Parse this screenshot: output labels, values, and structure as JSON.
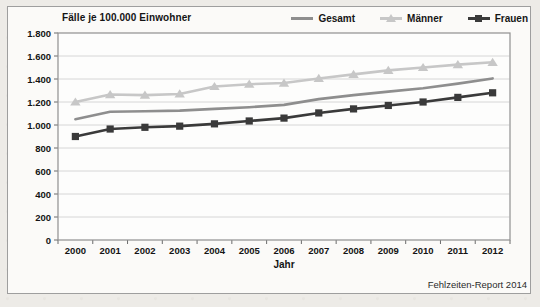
{
  "figure": {
    "title": "Fälle je 100.000 Einwohner",
    "x_axis_title": "Jahr",
    "source": "Fehlzeiten-Report 2014"
  },
  "colors": {
    "gesamt": "#8e8e8e",
    "maenner": "#c7c7c7",
    "frauen": "#3a3a3a",
    "grid": "#d6d6d6",
    "plot_border": "#8f8f8f",
    "plot_background": "#fdfdfc",
    "tick": "#6b6b6b",
    "text": "#141414"
  },
  "chart_data": {
    "type": "line",
    "title": "Fälle je 100.000 Einwohner",
    "xlabel": "Jahr",
    "ylabel": "Fälle je 100.000 Einwohner",
    "x": [
      2000,
      2001,
      2002,
      2003,
      2004,
      2005,
      2006,
      2007,
      2008,
      2009,
      2010,
      2011,
      2012
    ],
    "x_tick_labels": [
      "2000",
      "2001",
      "2002",
      "2003",
      "2004",
      "2005",
      "2006",
      "2007",
      "2008",
      "2009",
      "2010",
      "2011",
      "2012"
    ],
    "series": [
      {
        "name": "Gesamt",
        "marker": "none",
        "color": "#8e8e8e",
        "values": [
          1050,
          1115,
          1120,
          1125,
          1140,
          1155,
          1175,
          1225,
          1260,
          1290,
          1320,
          1360,
          1405
        ]
      },
      {
        "name": "Männer",
        "marker": "triangle",
        "color": "#c7c7c7",
        "values": [
          1200,
          1265,
          1260,
          1270,
          1335,
          1355,
          1365,
          1405,
          1440,
          1475,
          1500,
          1525,
          1545
        ]
      },
      {
        "name": "Frauen",
        "marker": "square",
        "color": "#3a3a3a",
        "values": [
          900,
          965,
          980,
          990,
          1010,
          1035,
          1060,
          1105,
          1140,
          1170,
          1200,
          1240,
          1280
        ]
      }
    ],
    "ylim": [
      0,
      1800
    ],
    "yticks": [
      0,
      200,
      400,
      600,
      800,
      1000,
      1200,
      1400,
      1600,
      1800
    ],
    "ytick_labels": [
      "0",
      "200",
      "400",
      "600",
      "800",
      "1.000",
      "1.200",
      "1.400",
      "1.600",
      "1.800"
    ],
    "grid": true,
    "legend_position": "top-right",
    "legend_order": [
      "Gesamt",
      "Männer",
      "Frauen"
    ],
    "source": "Fehlzeiten-Report 2014"
  }
}
